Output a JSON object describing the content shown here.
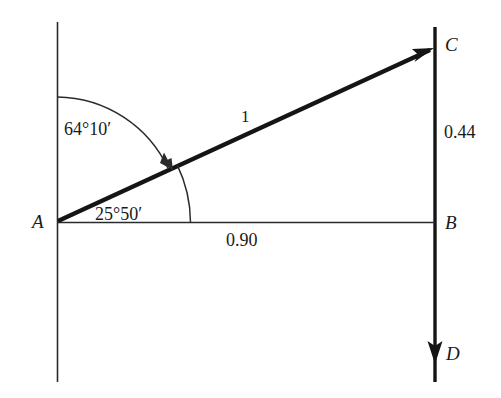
{
  "figure": {
    "type": "geometry-diagram",
    "background_color": "#ffffff",
    "stroke_color": "#1a1a1a",
    "points": [
      {
        "id": "A",
        "label": "A",
        "x": 57,
        "y": 221
      },
      {
        "id": "B",
        "label": "B",
        "x": 435,
        "y": 223
      },
      {
        "id": "C",
        "label": "C",
        "x": 435,
        "y": 48
      },
      {
        "id": "D",
        "label": "D",
        "x": 435,
        "y": 358
      }
    ],
    "angles": [
      {
        "id": "angle-from-vertical",
        "label": "64°10′",
        "degrees": 64,
        "minutes": 10,
        "vertex": "A",
        "from": "vertical-up",
        "to": "AC"
      },
      {
        "id": "angle-from-horizontal",
        "label": "25°50′",
        "degrees": 25,
        "minutes": 50,
        "vertex": "A",
        "from": "AB",
        "to": "AC"
      }
    ],
    "lengths": [
      {
        "id": "hypotenuse-AC",
        "label": "1",
        "value": 1,
        "segment": "AC"
      },
      {
        "id": "vertical-BC",
        "label": "0.44",
        "value": 0.44,
        "segment": "BC"
      },
      {
        "id": "horizontal-AB",
        "label": "0.90",
        "value": 0.9,
        "segment": "AB"
      }
    ],
    "arrows": [
      {
        "id": "arrow-to-C",
        "at": "C",
        "direction": "up-right"
      },
      {
        "id": "arrow-to-D",
        "at": "D",
        "direction": "down"
      },
      {
        "id": "arrow-angle-64",
        "on": "arc-64",
        "direction": "clockwise"
      }
    ]
  }
}
